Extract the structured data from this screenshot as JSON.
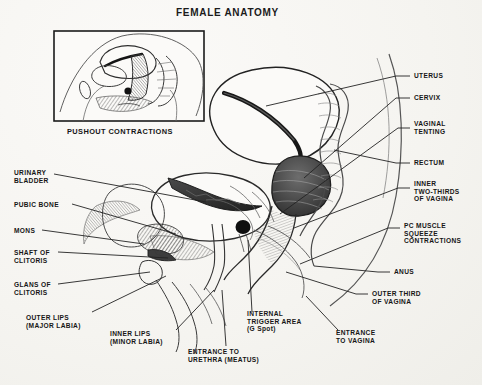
{
  "page": {
    "title": "FEMALE ANATOMY",
    "background_color": "#f7f6f3",
    "ink_color": "#1b1b1b"
  },
  "inset": {
    "caption": "PUSHOUT CONTRACTIONS",
    "border_color": "#1b1b1b"
  },
  "labels_left": [
    {
      "id": "urinary-bladder",
      "text": "URINARY\nBLADDER",
      "x": 14,
      "y": 169
    },
    {
      "id": "pubic-bone",
      "text": "PUBIC BONE",
      "x": 14,
      "y": 201
    },
    {
      "id": "mons",
      "text": "MONS",
      "x": 14,
      "y": 227
    },
    {
      "id": "shaft-of-clitoris",
      "text": "SHAFT OF\nCLITORIS",
      "x": 14,
      "y": 249
    },
    {
      "id": "glans-of-clitoris",
      "text": "GLANS OF\nCLITORIS",
      "x": 14,
      "y": 281
    }
  ],
  "labels_right": [
    {
      "id": "uterus",
      "text": "UTERUS",
      "x": 414,
      "y": 78
    },
    {
      "id": "cervix",
      "text": "CERVIX",
      "x": 414,
      "y": 100
    },
    {
      "id": "vaginal-tenting",
      "text": "VAGINAL\nTENTING",
      "x": 414,
      "y": 126
    },
    {
      "id": "rectum",
      "text": "RECTUM",
      "x": 414,
      "y": 165
    },
    {
      "id": "inner-two-thirds-of-vagina",
      "text": "INNER\nTWO-THIRDS\nOF VAGINA",
      "x": 414,
      "y": 186
    },
    {
      "id": "pc-muscle-squeeze-contractions",
      "text": "PC MUSCLE\nSQUEEZE\nCONTRACTIONS",
      "x": 404,
      "y": 225
    },
    {
      "id": "anus",
      "text": "ANUS",
      "x": 394,
      "y": 270
    },
    {
      "id": "outer-third-of-vagina",
      "text": "OUTER THIRD\nOF VAGINA",
      "x": 372,
      "y": 292
    }
  ],
  "labels_bottom": [
    {
      "id": "outer-lips",
      "text": "OUTER LIPS\n(MAJOR LABIA)",
      "x": 26,
      "y": 316
    },
    {
      "id": "inner-lips",
      "text": "INNER LIPS\n(MINOR LABIA)",
      "x": 110,
      "y": 332
    },
    {
      "id": "entrance-to-urethra",
      "text": "ENTRANCE TO\nURETHRA (MEATUS)",
      "x": 188,
      "y": 350
    },
    {
      "id": "internal-trigger-area",
      "text": "INTERNAL\nTRIGGER AREA\n(G Spot)",
      "x": 247,
      "y": 313
    },
    {
      "id": "entrance-to-vagina",
      "text": "ENTRANCE\nTO VAGINA",
      "x": 336,
      "y": 331
    }
  ]
}
